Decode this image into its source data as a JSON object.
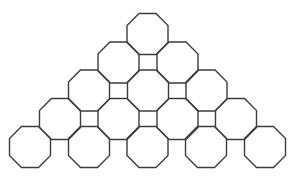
{
  "diagram": {
    "type": "tessellation",
    "stroke_color": "#3c3c3c",
    "background": "#ffffff",
    "octagon": {
      "width": 41,
      "side": 17
    },
    "rows": [
      {
        "y": 34,
        "xs": [
          147.5
        ]
      },
      {
        "y": 62.5,
        "xs": [
          118.5,
          177.5
        ]
      },
      {
        "y": 90.5,
        "xs": [
          89,
          148,
          206.5
        ]
      },
      {
        "y": 119,
        "xs": [
          60,
          118.5,
          177.5,
          236
        ]
      },
      {
        "y": 147,
        "xs": [
          30,
          89,
          147.5,
          206,
          265
        ]
      }
    ],
    "octagon_count": 15,
    "square_count": 6
  }
}
